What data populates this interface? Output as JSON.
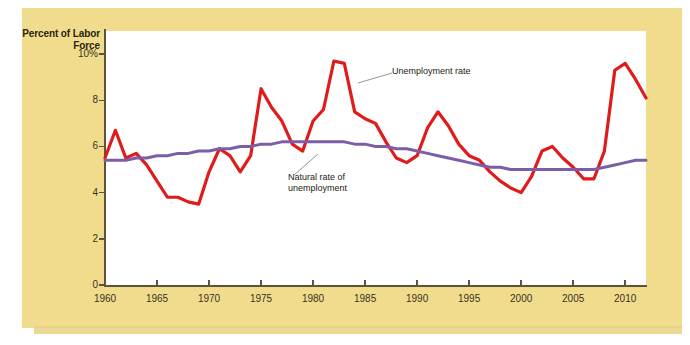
{
  "figure": {
    "axis_title": "Percent of\nLabor Force",
    "panel_color": "#F0DC8C",
    "plot_background": "#FFFFFF"
  },
  "annotations": {
    "unemployment_rate": "Unemployment rate",
    "natural_rate": "Natural rate of\nunemployment"
  },
  "chart_data": {
    "type": "line",
    "title": "",
    "subtitle": "",
    "xlabel": "",
    "ylabel": "Percent of Labor Force",
    "xlim": [
      1960,
      2012
    ],
    "ylim": [
      0,
      11
    ],
    "grid": false,
    "legend": "inline-annotations",
    "y_ticks": [
      "0",
      "2",
      "4",
      "6",
      "8",
      "10%"
    ],
    "y_tick_values": [
      0,
      2,
      4,
      6,
      8,
      10
    ],
    "x_ticks": [
      "1960",
      "1965",
      "1970",
      "1975",
      "1980",
      "1985",
      "1990",
      "1995",
      "2000",
      "2005",
      "2010"
    ],
    "x_tick_values": [
      1960,
      1965,
      1970,
      1975,
      1980,
      1985,
      1990,
      1995,
      2000,
      2005,
      2010
    ],
    "x": [
      1960,
      1961,
      1962,
      1963,
      1964,
      1965,
      1966,
      1967,
      1968,
      1969,
      1970,
      1971,
      1972,
      1973,
      1974,
      1975,
      1976,
      1977,
      1978,
      1979,
      1980,
      1981,
      1982,
      1983,
      1984,
      1985,
      1986,
      1987,
      1988,
      1989,
      1990,
      1991,
      1992,
      1993,
      1994,
      1995,
      1996,
      1997,
      1998,
      1999,
      2000,
      2001,
      2002,
      2003,
      2004,
      2005,
      2006,
      2007,
      2008,
      2009,
      2010,
      2011,
      2012
    ],
    "series": [
      {
        "name": "Unemployment rate",
        "color": "#E01B1B",
        "width": 3.2,
        "values": [
          5.5,
          6.7,
          5.5,
          5.7,
          5.2,
          4.5,
          3.8,
          3.8,
          3.6,
          3.5,
          4.9,
          5.9,
          5.6,
          4.9,
          5.6,
          8.5,
          7.7,
          7.1,
          6.1,
          5.8,
          7.1,
          7.6,
          9.7,
          9.6,
          7.5,
          7.2,
          7.0,
          6.2,
          5.5,
          5.3,
          5.6,
          6.8,
          7.5,
          6.9,
          6.1,
          5.6,
          5.4,
          4.9,
          4.5,
          4.2,
          4.0,
          4.7,
          5.8,
          6.0,
          5.5,
          5.1,
          4.6,
          4.6,
          5.8,
          9.3,
          9.6,
          8.9,
          8.1
        ]
      },
      {
        "name": "Natural rate of unemployment",
        "color": "#7B5EA7",
        "width": 3.0,
        "values": [
          5.4,
          5.4,
          5.4,
          5.5,
          5.5,
          5.6,
          5.6,
          5.7,
          5.7,
          5.8,
          5.8,
          5.9,
          5.9,
          6.0,
          6.0,
          6.1,
          6.1,
          6.2,
          6.2,
          6.2,
          6.2,
          6.2,
          6.2,
          6.2,
          6.1,
          6.1,
          6.0,
          6.0,
          5.9,
          5.9,
          5.8,
          5.7,
          5.6,
          5.5,
          5.4,
          5.3,
          5.2,
          5.1,
          5.1,
          5.0,
          5.0,
          5.0,
          5.0,
          5.0,
          5.0,
          5.0,
          5.0,
          5.0,
          5.1,
          5.2,
          5.3,
          5.4,
          5.4
        ]
      }
    ]
  }
}
